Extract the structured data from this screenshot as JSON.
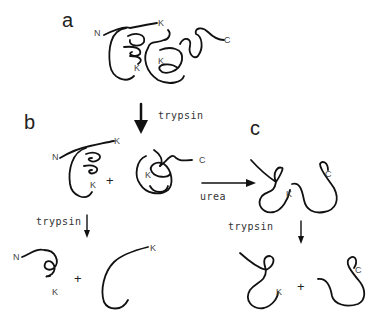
{
  "figure": {
    "panels": {
      "a": {
        "label": "a",
        "termini": {
          "n": "N",
          "c": "C"
        },
        "lysines": [
          "K",
          "K",
          "K"
        ]
      },
      "b": {
        "label": "b",
        "fragment1": {
          "n": "N",
          "k_top": "K",
          "k_bottom": "K"
        },
        "plus": "+",
        "fragment2": {
          "k": "K",
          "c": "C"
        },
        "step": "trypsin",
        "products": {
          "left": {
            "n": "N",
            "k": "K"
          },
          "plus": "+",
          "right": {
            "k": "K"
          }
        }
      },
      "c": {
        "label": "c",
        "unfolded": {
          "k": "K",
          "c": "C"
        },
        "step": "trypsin",
        "products": {
          "left": {
            "k": "K"
          },
          "plus": "+",
          "right": {
            "c": "C"
          }
        }
      }
    },
    "arrows": {
      "a_to_b": "trypsin",
      "b_to_c": "urea"
    },
    "colors": {
      "stroke": "#111111",
      "text": "#444444"
    }
  }
}
